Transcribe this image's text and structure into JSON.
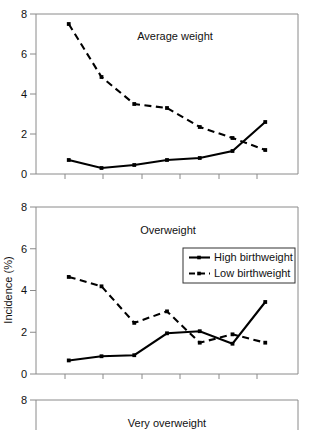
{
  "figure": {
    "ylabel": "Incidence (%)",
    "legend": {
      "entries": [
        {
          "label": "High birthweight",
          "style": "solid"
        },
        {
          "label": "Low birthweight",
          "style": "dashed"
        }
      ]
    }
  },
  "chart_data": [
    {
      "type": "line",
      "title": "Average weight",
      "xlabel": "",
      "ylabel": "Incidence (%)",
      "ylim": [
        0,
        8
      ],
      "yticks": [
        0,
        2,
        4,
        6,
        8
      ],
      "yticklabels": [
        "0",
        "2",
        "4",
        "6",
        "8"
      ],
      "xticklabels": [
        "",
        "",
        "",
        "",
        "",
        "",
        ""
      ],
      "grid": false,
      "legend_position": "none",
      "x": [
        1,
        2,
        3,
        4,
        5,
        6,
        7
      ],
      "series": [
        {
          "name": "High birthweight",
          "style": "solid",
          "values": [
            0.7,
            0.3,
            0.45,
            0.7,
            0.8,
            1.15,
            2.6
          ]
        },
        {
          "name": "Low birthweight",
          "style": "dashed",
          "values": [
            7.5,
            4.85,
            3.5,
            3.3,
            2.35,
            1.8,
            1.2
          ]
        }
      ]
    },
    {
      "type": "line",
      "title": "Overweight",
      "xlabel": "",
      "ylabel": "Incidence (%)",
      "ylim": [
        0,
        8
      ],
      "yticks": [
        0,
        2,
        4,
        6,
        8
      ],
      "yticklabels": [
        "0",
        "2",
        "4",
        "6",
        "8"
      ],
      "xticklabels": [
        "",
        "",
        "",
        "",
        "",
        "",
        ""
      ],
      "grid": false,
      "legend_position": "upper right",
      "x": [
        1,
        2,
        3,
        4,
        5,
        6,
        7
      ],
      "series": [
        {
          "name": "High birthweight",
          "style": "solid",
          "values": [
            0.65,
            0.85,
            0.9,
            1.95,
            2.05,
            1.45,
            3.45
          ]
        },
        {
          "name": "Low birthweight",
          "style": "dashed",
          "values": [
            4.65,
            4.2,
            2.45,
            3.0,
            1.5,
            1.9,
            1.5
          ]
        }
      ]
    },
    {
      "type": "line",
      "title": "Very overweight",
      "xlabel": "",
      "ylabel": "Incidence (%)",
      "ylim": [
        0,
        8
      ],
      "yticks": [
        8
      ],
      "yticklabels": [
        "8"
      ],
      "xticklabels": [],
      "grid": false,
      "legend_position": "none",
      "note": "panel cropped at image bottom edge",
      "x": [],
      "series": [
        {
          "name": "High birthweight",
          "style": "solid",
          "values": []
        },
        {
          "name": "Low birthweight",
          "style": "dashed",
          "values": []
        }
      ]
    }
  ]
}
